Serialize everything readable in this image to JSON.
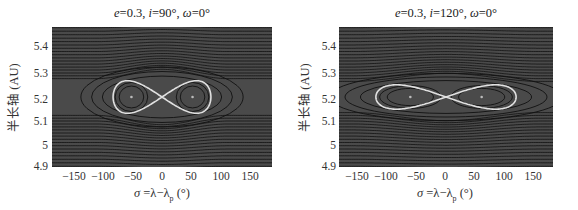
{
  "chart_data": [
    {
      "type": "heatmap",
      "subtype": "contour",
      "title": "e=0.3, i=90°, ω=0°",
      "title_parts": {
        "e": "0.3",
        "i": "90°",
        "omega": "0°"
      },
      "xlabel": "σ=λ−λp (°)",
      "ylabel": "半长轴 (AU)",
      "xlim": [
        -180,
        180
      ],
      "ylim": [
        4.9,
        5.5
      ],
      "xticks": [
        -150,
        -100,
        -50,
        0,
        50,
        100,
        150
      ],
      "yticks": [
        4.9,
        5.0,
        5.1,
        5.2,
        5.3,
        5.4
      ],
      "grid": false,
      "background": "#4a4a4a",
      "contour_color": "#111111",
      "separatrix_color": "#e0e0e0",
      "equilibria": [
        {
          "sigma": -50,
          "a": 5.2
        },
        {
          "sigma": 50,
          "a": 5.2
        }
      ],
      "saddle": {
        "sigma": 0,
        "a": 5.2
      },
      "separatrix_extent": {
        "sigma": [
          -80,
          80
        ],
        "a": [
          5.13,
          5.27
        ]
      }
    },
    {
      "type": "heatmap",
      "subtype": "contour",
      "title": "e=0.3, i=120°, ω=0°",
      "title_parts": {
        "e": "0.3",
        "i": "120°",
        "omega": "0°"
      },
      "xlabel": "σ=λ−λp (°)",
      "ylabel": "半长轴 (AU)",
      "xlim": [
        -180,
        180
      ],
      "ylim": [
        4.9,
        5.5
      ],
      "xticks": [
        -150,
        -100,
        -50,
        0,
        50,
        100,
        150
      ],
      "yticks": [
        4.9,
        5.0,
        5.1,
        5.2,
        5.3,
        5.4
      ],
      "grid": false,
      "background": "#4a4a4a",
      "contour_color": "#111111",
      "separatrix_color": "#e0e0e0",
      "equilibria": [
        {
          "sigma": -60,
          "a": 5.2
        },
        {
          "sigma": 60,
          "a": 5.2
        }
      ],
      "saddle": {
        "sigma": 0,
        "a": 5.2
      },
      "separatrix_extent": {
        "sigma": [
          -118,
          118
        ],
        "a": [
          5.15,
          5.26
        ]
      }
    }
  ],
  "panels": [
    {
      "title_e": "e",
      "title_e_val": "=0.3, ",
      "title_i": "i",
      "title_i_val": "=90°, ",
      "title_w": "ω",
      "title_w_val": "=0°",
      "ylabel": "半长轴 (AU)",
      "xlabel_pre": "σ",
      "xlabel_mid": " =λ−λ",
      "xlabel_sub": "p",
      "xlabel_post": " (°)",
      "yticks": [
        "5.4",
        "5.3",
        "5.2",
        "5.1",
        "5",
        "4.9"
      ],
      "xticks": [
        "−150",
        "−100",
        "−50",
        "0",
        "50",
        "100",
        "150"
      ]
    },
    {
      "title_e": "e",
      "title_e_val": "=0.3, ",
      "title_i": "i",
      "title_i_val": "=120°, ",
      "title_w": "ω",
      "title_w_val": "=0°",
      "ylabel": "半长轴 (AU)",
      "xlabel_pre": "σ",
      "xlabel_mid": " =λ−λ",
      "xlabel_sub": "p",
      "xlabel_post": " (°)",
      "yticks": [
        "5.4",
        "5.3",
        "5.2",
        "5.1",
        "5",
        "4.9"
      ],
      "xticks": [
        "−150",
        "−100",
        "−50",
        "0",
        "50",
        "100",
        "150"
      ]
    }
  ]
}
